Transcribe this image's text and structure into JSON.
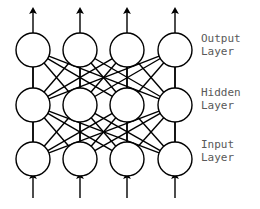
{
  "diagram": {
    "type": "neural-network",
    "background_color": "#ffffff",
    "stroke_color": "#000000",
    "label_color": "#595959",
    "node_fill": "#ffffff",
    "node_radius": 17,
    "stroke_width": 1.4,
    "columns_x": [
      33,
      80,
      127,
      175
    ],
    "layers": [
      {
        "id": "output",
        "name": "output-layer",
        "y": 50,
        "node_count": 4,
        "label_lines": [
          "Output",
          "Layer"
        ],
        "label_x": 201,
        "label_y": 32
      },
      {
        "id": "hidden",
        "name": "hidden-layer",
        "y": 105,
        "node_count": 4,
        "label_lines": [
          "Hidden",
          "Layer"
        ],
        "label_x": 201,
        "label_y": 86
      },
      {
        "id": "input",
        "name": "input-layer",
        "y": 159,
        "node_count": 4,
        "label_lines": [
          "Input",
          "Layer"
        ],
        "label_x": 201,
        "label_y": 138
      }
    ],
    "connections": {
      "input_to_hidden": "full",
      "hidden_to_output": "full",
      "vertical_same_column": true
    },
    "arrows": {
      "output_arrows": {
        "direction": "up",
        "count": 4,
        "tip_y": 11,
        "tail_y": 33
      },
      "input_arrows": {
        "direction": "up",
        "count": 4,
        "tip_y": 176,
        "tail_y": 198
      }
    }
  }
}
